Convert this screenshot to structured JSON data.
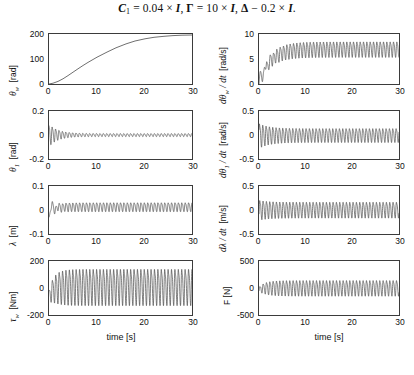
{
  "figure": {
    "title_plain": "C1 = 0.04 × I,  Γ = 10 × I,  Δ − 0.2 × I.",
    "title_parts": {
      "c": "C",
      "c_sub": "1",
      "eq1": " = 0.04 × ",
      "i1": "I",
      "comma1": ",  ",
      "gamma": "Γ",
      "eq2": " = 10 × ",
      "i2": "I",
      "comma2": ",  ",
      "delta": "Δ",
      "eq3": " − 0.2 × ",
      "i3": "I",
      "period": "."
    },
    "background": "#ffffff",
    "line_color": "#4a4a4a",
    "axis_color": "#3b3b3b",
    "text_color": "#111111"
  },
  "chart_data": [
    {
      "id": "theta-w",
      "type": "line",
      "position": "row1-left",
      "title": "",
      "xlabel": "",
      "ylabel": "θ_w  [rad]",
      "ylabel_symbol": "θ",
      "ylabel_subscript": "w",
      "ylabel_unit": "[rad]",
      "xlim": [
        0,
        30
      ],
      "ylim": [
        0,
        200
      ],
      "xticks": [
        0,
        10,
        20,
        30
      ],
      "xticklabels": [
        "0",
        "10",
        "20",
        "30"
      ],
      "yticks": [
        0,
        100,
        200
      ],
      "yticklabels": [
        "0",
        "100",
        "200"
      ],
      "grid": false,
      "waveform": "ramp",
      "description": "Monotonic nearly-linear ramp from 0 rad at t=0 to about 195 rad at t=30 s, slightly convex at the start.",
      "x": [
        0,
        1,
        2,
        3,
        4,
        5,
        6,
        7,
        8,
        9,
        10,
        12,
        14,
        16,
        18,
        20,
        22,
        24,
        26,
        28,
        30
      ],
      "values": [
        0,
        1.5,
        5,
        10,
        16,
        23,
        30,
        37,
        44,
        51,
        58,
        72,
        86,
        100,
        114,
        128,
        141,
        155,
        168,
        181,
        195
      ]
    },
    {
      "id": "dtheta-w-dt",
      "type": "line",
      "position": "row1-right",
      "title": "",
      "xlabel": "",
      "ylabel": "dθ_w / dt  [rad/s]",
      "ylabel_symbol": "dθ",
      "ylabel_subscript": "w",
      "ylabel_rest": " / dt",
      "ylabel_unit": "[rad/s]",
      "xlim": [
        0,
        30
      ],
      "ylim": [
        0,
        10
      ],
      "xticks": [
        0,
        10,
        20,
        30
      ],
      "xticklabels": [
        "0",
        "10",
        "20",
        "30"
      ],
      "yticks": [
        0,
        5,
        10
      ],
      "yticklabels": [
        "0",
        "5",
        "10"
      ],
      "grid": false,
      "waveform": "rising-oscillation",
      "description": "Starts at 0, rises with growing oscillation to a steady limit cycle with mean about 7 rad/s and ripple from about 5.5 to 8.7 rad/s, oscillation frequency about 1.4 Hz.",
      "mean_start": 0.2,
      "mean_final": 7.0,
      "ripple_amplitude": 1.5,
      "frequency_hz": 1.4
    },
    {
      "id": "theta-1",
      "type": "line",
      "position": "row2-left",
      "title": "",
      "xlabel": "",
      "ylabel": "θ_1  [rad]",
      "ylabel_symbol": "θ",
      "ylabel_subscript": "1",
      "ylabel_unit": "[rad]",
      "xlim": [
        0,
        30
      ],
      "ylim": [
        -0.2,
        0.2
      ],
      "xticks": [
        0,
        10,
        20,
        30
      ],
      "xticklabels": [
        "0",
        "10",
        "20",
        "30"
      ],
      "yticks": [
        -0.2,
        0,
        0.2
      ],
      "yticklabels": [
        "-0.2",
        "0",
        "0.2"
      ],
      "grid": false,
      "waveform": "damped-oscillation",
      "description": "Damped oscillation starting near +0.09 rad, decaying within about 6 s to a small steady ripple of roughly ±0.012 rad about zero.",
      "initial_amplitude": 0.09,
      "final_amplitude": 0.012,
      "mean_final": 0.0,
      "frequency_hz": 1.4
    },
    {
      "id": "dtheta-1-dt",
      "type": "line",
      "position": "row2-right",
      "title": "",
      "xlabel": "",
      "ylabel": "dθ_1 / dt  [rad/s]",
      "ylabel_symbol": "dθ",
      "ylabel_subscript": "1",
      "ylabel_rest": " / dt",
      "ylabel_unit": "[rad/s]",
      "xlim": [
        0,
        30
      ],
      "ylim": [
        -0.5,
        0.5
      ],
      "xticks": [
        0,
        10,
        20,
        30
      ],
      "xticklabels": [
        "0",
        "10",
        "20",
        "30"
      ],
      "yticks": [
        -0.5,
        0,
        0.5
      ],
      "yticklabels": [
        "-0.5",
        "0",
        "0.5"
      ],
      "grid": false,
      "waveform": "sustained-oscillation",
      "description": "Oscillation about zero, initial transient to about ±0.25 rad/s, settling to sustained ripple of roughly ±0.14 rad/s.",
      "initial_amplitude": 0.25,
      "final_amplitude": 0.14,
      "mean_final": 0.0,
      "frequency_hz": 1.4
    },
    {
      "id": "lambda",
      "type": "line",
      "position": "row3-left",
      "title": "",
      "xlabel": "",
      "ylabel": "λ  [m]",
      "ylabel_symbol": "λ",
      "ylabel_unit": "[m]",
      "xlim": [
        0,
        30
      ],
      "ylim": [
        -0.1,
        0.1
      ],
      "xticks": [
        0,
        10,
        20,
        30
      ],
      "xticklabels": [
        "0",
        "10",
        "20",
        "30"
      ],
      "yticks": [
        -0.1,
        0,
        0.1
      ],
      "yticklabels": [
        "-0.1",
        "0",
        "0.1"
      ],
      "grid": false,
      "waveform": "offset-oscillation",
      "description": "After a brief transient dipping to about -0.04 m, settles to an oscillation with mean near +0.013 m and ripple about ±0.018 m.",
      "mean_final": 0.013,
      "final_amplitude": 0.018,
      "initial_dip": -0.04,
      "frequency_hz": 1.4
    },
    {
      "id": "dlambda-dt",
      "type": "line",
      "position": "row3-right",
      "title": "",
      "xlabel": "",
      "ylabel": "dλ / dt  [m/s]",
      "ylabel_symbol": "dλ",
      "ylabel_rest": " / dt",
      "ylabel_unit": "[m/s]",
      "xlim": [
        0,
        30
      ],
      "ylim": [
        -0.5,
        0.5
      ],
      "xticks": [
        0,
        10,
        20,
        30
      ],
      "xticklabels": [
        "0",
        "10",
        "20",
        "30"
      ],
      "yticks": [
        -0.5,
        0,
        0.5
      ],
      "yticklabels": [
        "-0.5",
        "0",
        "0.5"
      ],
      "grid": false,
      "waveform": "sustained-oscillation",
      "description": "Oscillation about zero with peaks near +0.18 m/s and troughs near -0.14 m/s, steady amplitude after about 3 s.",
      "initial_amplitude": 0.2,
      "final_amplitude": 0.16,
      "mean_final": 0.01,
      "frequency_hz": 1.4
    },
    {
      "id": "tau-w",
      "type": "line",
      "position": "row4-left",
      "title": "",
      "xlabel": "time [s]",
      "ylabel": "τ_w  [Nm]",
      "ylabel_symbol": "τ",
      "ylabel_subscript": "w",
      "ylabel_unit": "[Nm]",
      "xlim": [
        0,
        30
      ],
      "ylim": [
        -200,
        200
      ],
      "xticks": [
        0,
        10,
        20,
        30
      ],
      "xticklabels": [
        "0",
        "10",
        "20",
        "30"
      ],
      "yticks": [
        -200,
        0,
        200
      ],
      "yticklabels": [
        "-200",
        "0",
        "200"
      ],
      "grid": false,
      "waveform": "large-sustained-oscillation",
      "description": "Control torque oscillating about zero, starting near -60 Nm then a large sustained limit cycle with peaks around +150 Nm and troughs around -110 Nm.",
      "peak_high": 150,
      "peak_low": -110,
      "mean_final": 15,
      "frequency_hz": 1.4
    },
    {
      "id": "force-F",
      "type": "line",
      "position": "row4-right",
      "title": "",
      "xlabel": "time [s]",
      "ylabel": "F [N]",
      "ylabel_symbol": "F",
      "ylabel_unit": "[N]",
      "xlim": [
        0,
        30
      ],
      "ylim": [
        -500,
        500
      ],
      "xticks": [
        0,
        10,
        20,
        30
      ],
      "xticklabels": [
        "0",
        "10",
        "20",
        "30"
      ],
      "yticks": [
        -500,
        0,
        500
      ],
      "yticklabels": [
        "-500",
        "0",
        "500"
      ],
      "grid": false,
      "waveform": "sustained-oscillation",
      "description": "Contact force oscillating about zero with peaks near +140 N and troughs near -140 N after a short initial transient.",
      "peak_high": 140,
      "peak_low": -140,
      "mean_final": 5,
      "frequency_hz": 1.4
    }
  ]
}
